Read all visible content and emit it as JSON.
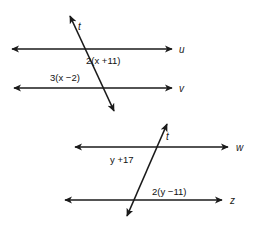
{
  "figure": {
    "stroke_color": "#1a1a1a",
    "background": "#ffffff"
  },
  "diagram_top": {
    "transversal_label": "t",
    "line_upper_label": "u",
    "line_lower_label": "v",
    "angle_expression_upper": "2(x +11)",
    "angle_expression_lower": "3(x −2)"
  },
  "diagram_bottom": {
    "transversal_label": "t",
    "line_upper_label": "w",
    "line_lower_label": "z",
    "angle_expression_upper": "y +17",
    "angle_expression_lower": "2(y −11)"
  }
}
